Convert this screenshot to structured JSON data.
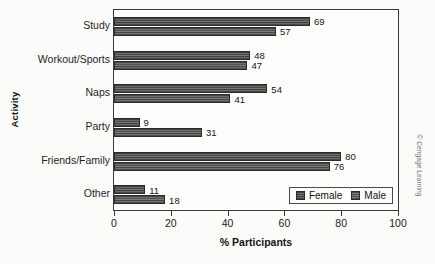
{
  "chart_data": {
    "type": "bar",
    "orientation": "horizontal",
    "title": "",
    "xlabel": "% Participants",
    "ylabel": "Activity",
    "categories": [
      "Study",
      "Workout/Sports",
      "Naps",
      "Party",
      "Friends/Family",
      "Other"
    ],
    "series": [
      {
        "name": "Female",
        "values": [
          69,
          48,
          54,
          9,
          80,
          11
        ]
      },
      {
        "name": "Male",
        "values": [
          57,
          47,
          41,
          31,
          76,
          18
        ]
      }
    ],
    "xlim": [
      0,
      100
    ],
    "xticks": [
      0,
      20,
      40,
      60,
      80,
      100
    ],
    "xticklabels": [
      "0",
      "20",
      "40",
      "60",
      "80",
      "100"
    ],
    "grid": false,
    "legend_position": "bottom-right-inside",
    "legend_entries": [
      "Female",
      "Male"
    ],
    "value_labels_shown": true
  },
  "credit": {
    "text": "© Cengage Learning"
  },
  "page_artifact": {
    "text": ""
  }
}
